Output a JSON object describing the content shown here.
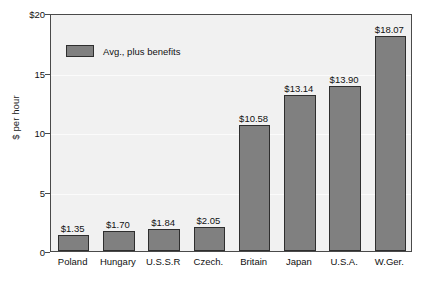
{
  "chart_data": {
    "type": "bar",
    "title": "",
    "subtitle": "",
    "xlabel": "",
    "ylabel": "$ per hour",
    "ylim": [
      0,
      20
    ],
    "yticks": [
      0,
      5,
      10,
      15,
      20
    ],
    "ytick_labels": [
      "0",
      "5",
      "10",
      "15",
      "$20"
    ],
    "grid": true,
    "legend_position": "upper-left-inside",
    "categories": [
      "Poland",
      "Hungary",
      "U.S.S.R",
      "Czech.",
      "Britain",
      "Japan",
      "U.S.A.",
      "W.Ger."
    ],
    "series": [
      {
        "name": "Avg., plus benefits",
        "color": "#808080",
        "values": [
          1.35,
          1.7,
          1.84,
          2.05,
          10.58,
          13.14,
          13.9,
          18.07
        ],
        "data_labels": [
          "$1.35",
          "$1.70",
          "$1.84",
          "$2.05",
          "$10.58",
          "$13.14",
          "$13.90",
          "$18.07"
        ]
      }
    ]
  },
  "legend": {
    "entries": [
      {
        "label": "Avg., plus benefits",
        "color": "#808080"
      }
    ]
  },
  "colors": {
    "bar_fill": "#808080",
    "bar_stroke": "#2e2e2e",
    "plot_background": "#f1f1f1",
    "frame": "#4a4a4a",
    "text": "#111111",
    "gridline": "#fbfbfb"
  }
}
